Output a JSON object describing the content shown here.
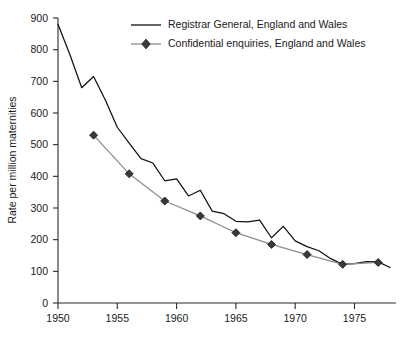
{
  "chart_data": {
    "type": "line",
    "title": "",
    "subtitle": "",
    "xlabel": "",
    "ylabel": "Rate per million maternities",
    "xlim": [
      1950,
      1978.5
    ],
    "ylim": [
      0,
      900
    ],
    "grid": false,
    "legend_position": "top-center",
    "x_ticks": [
      1950,
      1955,
      1960,
      1965,
      1970,
      1975
    ],
    "x_tick_labels": [
      "1950",
      "1955",
      "1960",
      "1965",
      "1970",
      "1975"
    ],
    "y_ticks": [
      0,
      100,
      200,
      300,
      400,
      500,
      600,
      700,
      800,
      900
    ],
    "y_tick_labels": [
      "0",
      "100",
      "200",
      "300",
      "400",
      "500",
      "600",
      "700",
      "800",
      "900"
    ],
    "series": [
      {
        "name": "Registrar General, England and Wales",
        "color": "#111111",
        "marker": "none",
        "x": [
          1950,
          1951,
          1952,
          1953,
          1954,
          1955,
          1956,
          1957,
          1958,
          1959,
          1960,
          1961,
          1962,
          1963,
          1964,
          1965,
          1966,
          1967,
          1968,
          1969,
          1970,
          1971,
          1972,
          1973,
          1974,
          1975,
          1976,
          1977,
          1978
        ],
        "values": [
          880,
          785,
          680,
          715,
          640,
          555,
          505,
          456,
          442,
          386,
          392,
          338,
          356,
          290,
          282,
          258,
          256,
          262,
          206,
          242,
          196,
          178,
          165,
          140,
          122,
          124,
          131,
          130,
          112
        ]
      },
      {
        "name": "Confidential enquiries, England and Wales",
        "color": "#8d8d8d",
        "marker": "diamond",
        "x": [
          1953,
          1956,
          1959,
          1962,
          1965,
          1968,
          1971,
          1974,
          1977
        ],
        "values": [
          530,
          408,
          322,
          275,
          222,
          185,
          153,
          122,
          128
        ]
      }
    ],
    "legend_entries": [
      {
        "label": "Registrar General, England and Wales",
        "style": "line",
        "color": "#111111"
      },
      {
        "label": "Confidential enquiries, England and Wales",
        "style": "line-diamond",
        "color": "#8d8d8d"
      }
    ]
  }
}
